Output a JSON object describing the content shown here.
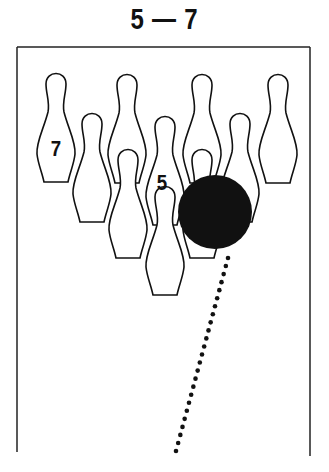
{
  "title": "5 — 7",
  "diagram": {
    "pin_labels": {
      "left_back": "7",
      "center": "5"
    },
    "pins": [
      {
        "id": "pin-7",
        "cx": 56,
        "top": 72,
        "label": "7"
      },
      {
        "id": "pin-8",
        "cx": 127,
        "top": 73,
        "label": ""
      },
      {
        "id": "pin-9",
        "cx": 202,
        "top": 73,
        "label": ""
      },
      {
        "id": "pin-10",
        "cx": 278,
        "top": 73,
        "label": ""
      },
      {
        "id": "pin-4",
        "cx": 92,
        "top": 112,
        "label": ""
      },
      {
        "id": "pin-5",
        "cx": 165,
        "top": 115,
        "label": "5"
      },
      {
        "id": "pin-6",
        "cx": 240,
        "top": 112,
        "label": ""
      },
      {
        "id": "pin-2",
        "cx": 128,
        "top": 148,
        "label": ""
      },
      {
        "id": "pin-3",
        "cx": 202,
        "top": 148,
        "label": ""
      },
      {
        "id": "pin-1",
        "cx": 165,
        "top": 185,
        "label": ""
      }
    ],
    "ball": {
      "cx": 215,
      "cy": 212,
      "r": 37,
      "color": "#111111"
    },
    "ball_path": {
      "from": [
        228,
        258
      ],
      "to": [
        176,
        451
      ],
      "dot_count": 25
    }
  }
}
